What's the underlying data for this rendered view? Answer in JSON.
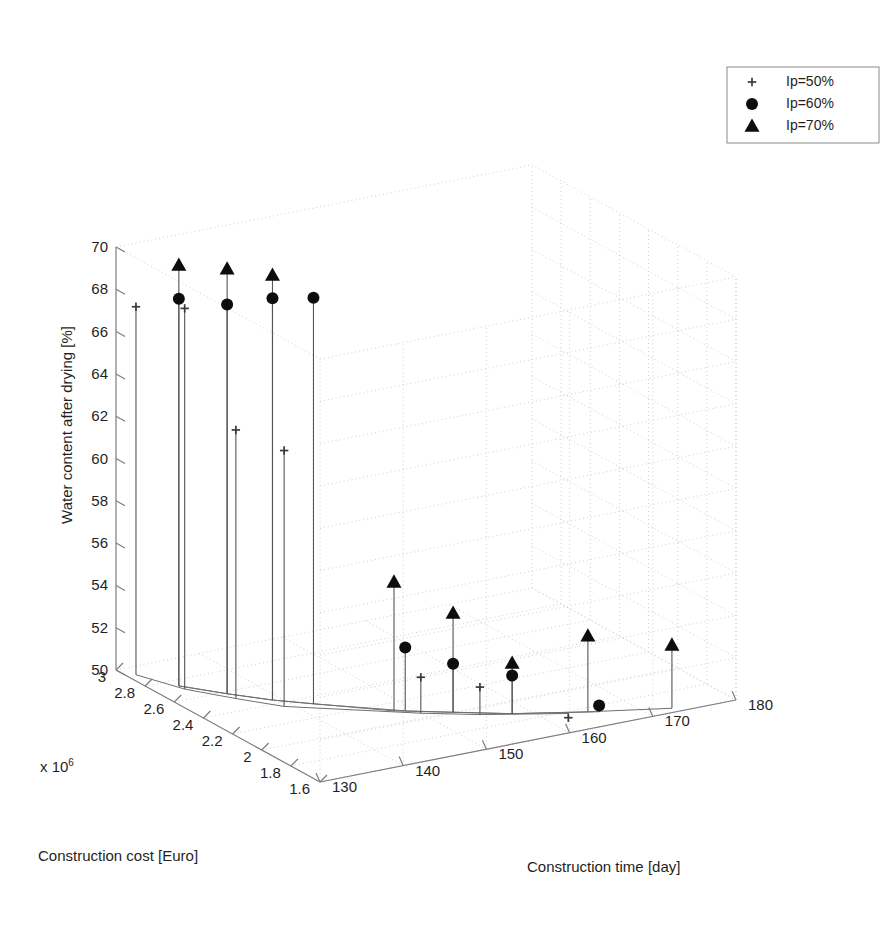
{
  "figure": {
    "background": "#ffffff",
    "ink": "#1a1a1a",
    "grid_color": "#c9c9c9",
    "axis_color": "#8a8a8a",
    "stem_color": "#555555"
  },
  "legend": {
    "position": "top-right",
    "entries": [
      {
        "marker": "plus-marker",
        "label": "Ip=50%"
      },
      {
        "marker": "circle-marker",
        "label": "Ip=60%"
      },
      {
        "marker": "triangle-marker",
        "label": "Ip=70%"
      }
    ]
  },
  "axes": {
    "x": {
      "label": "Construction cost [Euro]",
      "exponent_prefix": "x 10",
      "exponent_power": "6",
      "ticks": [
        "3",
        "2.8",
        "2.6",
        "2.4",
        "2.2",
        "2",
        "1.8",
        "1.6"
      ],
      "min": 1.6,
      "max": 3.0,
      "step": 0.2
    },
    "y": {
      "label": "Construction time [day]",
      "ticks": [
        "130",
        "140",
        "150",
        "160",
        "170",
        "180"
      ],
      "min": 130,
      "max": 180,
      "step": 10
    },
    "z": {
      "label": "Water content after drying [%]",
      "ticks": [
        "50",
        "52",
        "54",
        "56",
        "58",
        "60",
        "62",
        "64",
        "66",
        "68",
        "70"
      ],
      "min": 50,
      "max": 70,
      "step": 2
    }
  },
  "chart_data": {
    "type": "scatter",
    "title": "",
    "xlabel": "Construction cost [Euro]",
    "ylabel": "Construction time [day]",
    "zlabel": "Water content after drying [%]",
    "xlim": [
      1.6,
      3.0
    ],
    "ylim": [
      130,
      180
    ],
    "zlim": [
      50,
      70
    ],
    "x_exponent": 1000000,
    "grid": true,
    "legend_position": "top-right",
    "projection": "3d-stem",
    "series": [
      {
        "name": "Ip=50%",
        "marker": "plus",
        "points": [
          {
            "x": 2.92,
            "y": 131,
            "z": 67.4
          },
          {
            "x": 2.7,
            "y": 133,
            "z": 68.0
          },
          {
            "x": 2.52,
            "y": 136,
            "z": 62.7
          },
          {
            "x": 2.36,
            "y": 139,
            "z": 62.1
          },
          {
            "x": 2.05,
            "y": 150,
            "z": 51.7
          },
          {
            "x": 1.93,
            "y": 155,
            "z": 51.3
          },
          {
            "x": 1.78,
            "y": 163,
            "z": 49.8
          }
        ]
      },
      {
        "name": "Ip=60%",
        "marker": "circle",
        "points": [
          {
            "x": 2.74,
            "y": 133,
            "z": 68.3
          },
          {
            "x": 2.58,
            "y": 136,
            "z": 68.4
          },
          {
            "x": 2.44,
            "y": 139,
            "z": 69.0
          },
          {
            "x": 2.33,
            "y": 142,
            "z": 69.2
          },
          {
            "x": 2.1,
            "y": 149,
            "z": 53.0
          },
          {
            "x": 2.0,
            "y": 153,
            "z": 52.3
          },
          {
            "x": 1.88,
            "y": 158,
            "z": 51.8
          },
          {
            "x": 1.74,
            "y": 166,
            "z": 50.3
          }
        ]
      },
      {
        "name": "Ip=70%",
        "marker": "triangle",
        "points": [
          {
            "x": 2.74,
            "y": 133,
            "z": 69.9
          },
          {
            "x": 2.58,
            "y": 136,
            "z": 70.1
          },
          {
            "x": 2.44,
            "y": 139,
            "z": 70.1
          },
          {
            "x": 2.12,
            "y": 148,
            "z": 56.1
          },
          {
            "x": 2.0,
            "y": 153,
            "z": 54.7
          },
          {
            "x": 1.88,
            "y": 158,
            "z": 52.4
          },
          {
            "x": 1.76,
            "y": 165,
            "z": 53.6
          },
          {
            "x": 1.64,
            "y": 173,
            "z": 53.0
          }
        ]
      }
    ]
  }
}
